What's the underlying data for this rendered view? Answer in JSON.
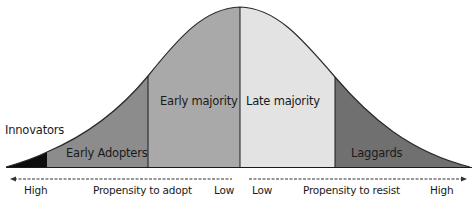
{
  "diagram": {
    "type": "bell-curve",
    "segments": [
      {
        "name": "Innovators",
        "label": "Innovators",
        "color": "#0d0d0d"
      },
      {
        "name": "Early Adopters",
        "label": "Early Adopters",
        "color": "#8c8c8c"
      },
      {
        "name": "Early majority",
        "label": "Early majority",
        "color": "#a9a9a9"
      },
      {
        "name": "Late majority",
        "label": "Late majority",
        "color": "#e3e3e3"
      },
      {
        "name": "Laggards",
        "label": "Laggards",
        "color": "#707070"
      }
    ],
    "axes": {
      "left": {
        "title": "Propensity to adopt",
        "start": "High",
        "end": "Low",
        "direction": "left"
      },
      "right": {
        "title": "Propensity to resist",
        "start": "Low",
        "end": "High",
        "direction": "right"
      }
    }
  }
}
